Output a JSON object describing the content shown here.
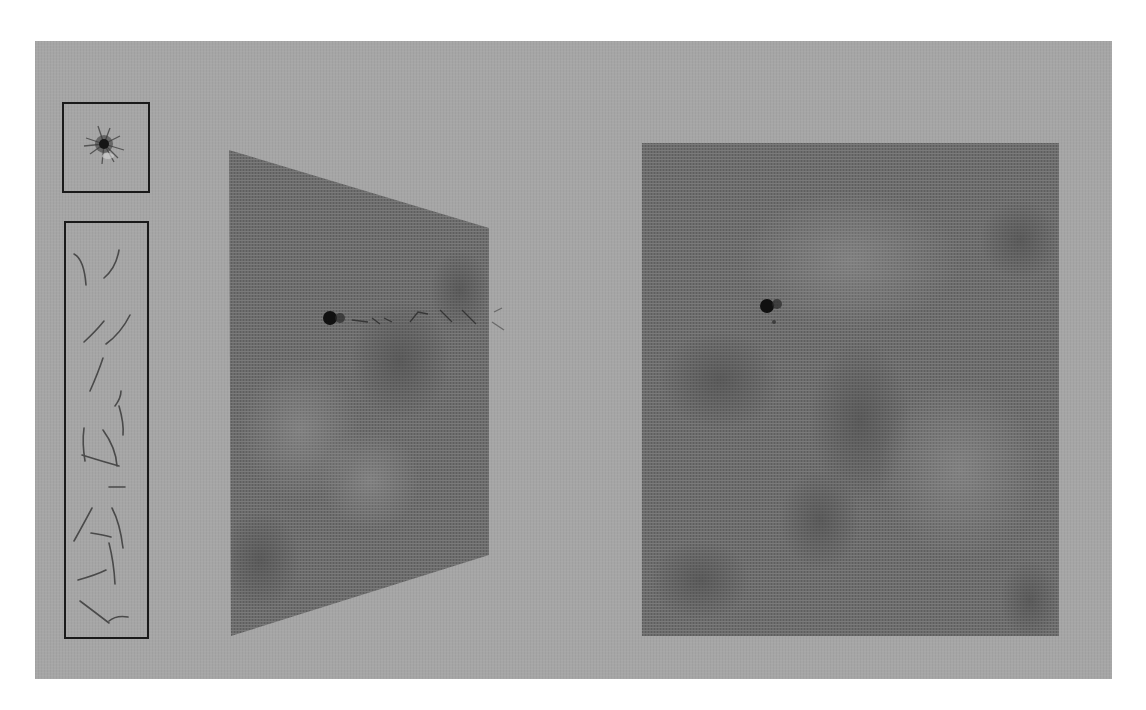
{
  "scene": {
    "background_color": "#ffffff",
    "panel_color": "#a6a6a6",
    "plane_color": "#6e6e6e",
    "border_color": "#1a1a1a"
  },
  "left_column": {
    "thumbnail": {
      "label": "particle-cluster-thumbnail",
      "icon": "starburst"
    },
    "track_strip": {
      "label": "track-fragments-strip",
      "fragment_count": 16
    }
  },
  "views": [
    {
      "name": "perspective-view",
      "projection": "oblique"
    },
    {
      "name": "front-view",
      "projection": "orthographic"
    }
  ]
}
